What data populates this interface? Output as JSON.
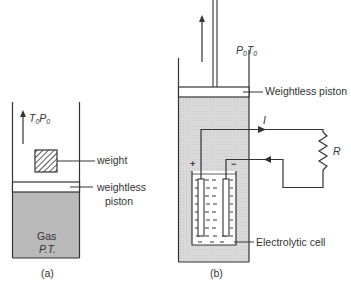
{
  "figure_a": {
    "caption": "(a)",
    "ambient_label": {
      "T": "T",
      "T_sub": "0",
      "P": "P",
      "P_sub": "0"
    },
    "weight_label": "weight",
    "piston_label_line1": "weightless",
    "piston_label_line2": "piston",
    "gas_label_line1": "Gas",
    "gas_label_line2": "P.T."
  },
  "figure_b": {
    "caption": "(b)",
    "ambient_label": {
      "P": "P",
      "P_sub": "0",
      "T": "T",
      "T_sub": "0"
    },
    "piston_label": "Weightless piston",
    "current_label": "I",
    "resistor_label": "R",
    "cell_label": "Electrolytic cell",
    "plus_sign": "+",
    "minus_sign": "−"
  },
  "colors": {
    "line": "#3a3a3a",
    "gas_fill": "#b8b8b8",
    "gas_fill_light": "#d6d6d6",
    "background": "#ffffff"
  }
}
